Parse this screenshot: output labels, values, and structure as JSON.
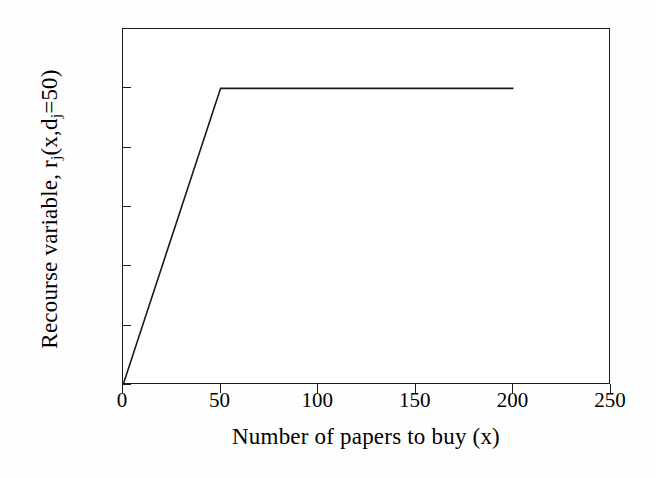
{
  "chart_data": {
    "type": "line",
    "title": "",
    "subtitle": "",
    "xlabel": "Number of papers to buy (x)",
    "ylabel_parts": {
      "lead": "Recourse variable, r",
      "sub1": "j",
      "mid": "(x,d",
      "sub2": "j",
      "tail": "=50)"
    },
    "ylabel": "Recourse variable, rj(x,dj=50)",
    "xlim": [
      0,
      250
    ],
    "ylim": [
      0,
      60
    ],
    "xticks": [
      0,
      50,
      100,
      150,
      200,
      250
    ],
    "yticks": [
      0,
      10,
      20,
      30,
      40,
      50,
      60
    ],
    "grid": false,
    "legend": null,
    "series": [
      {
        "name": "r_j(x, d_j=50)",
        "color": "#1a1a1a",
        "linewidth": 1.6,
        "points": [
          {
            "x": 0,
            "y": 0
          },
          {
            "x": 50,
            "y": 50
          },
          {
            "x": 200,
            "y": 50
          }
        ]
      }
    ],
    "annotations": []
  },
  "axes": {
    "x_tick_labels": [
      "0",
      "50",
      "100",
      "150",
      "200",
      "250"
    ],
    "y_tick_labels": [
      "0",
      "10",
      "20",
      "30",
      "40",
      "50",
      "60"
    ]
  },
  "style": {
    "background": "#fefefe",
    "plot_background": "#ffffff",
    "frame_color": "#1a1a1a",
    "line_color": "#1a1a1a",
    "text_color": "#000000"
  }
}
